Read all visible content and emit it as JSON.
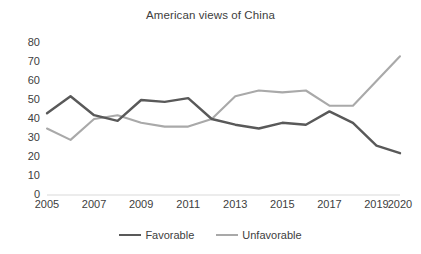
{
  "chart_data": {
    "type": "line",
    "title": "American views of China",
    "xlabel": "",
    "ylabel": "",
    "ylim": [
      0,
      80
    ],
    "yticks": [
      0,
      10,
      20,
      30,
      40,
      50,
      60,
      70,
      80
    ],
    "xticklabels": [
      "2005",
      "2007",
      "2009",
      "2011",
      "2013",
      "2015",
      "2017",
      "2019",
      "2020"
    ],
    "x": [
      2005,
      2006,
      2007,
      2008,
      2009,
      2010,
      2011,
      2012,
      2013,
      2014,
      2015,
      2016,
      2017,
      2018,
      2019,
      2020
    ],
    "grid": false,
    "legend_position": "bottom",
    "series": [
      {
        "name": "Favorable",
        "color": "#595959",
        "values": [
          43,
          52,
          42,
          39,
          50,
          49,
          51,
          40,
          37,
          35,
          38,
          37,
          44,
          38,
          26,
          22
        ]
      },
      {
        "name": "Unfavorable",
        "color": "#a9a9a9",
        "values": [
          35,
          29,
          40,
          42,
          38,
          36,
          36,
          40,
          52,
          55,
          54,
          55,
          47,
          47,
          60,
          73
        ]
      }
    ]
  },
  "legend": {
    "entries": [
      {
        "label": "Favorable"
      },
      {
        "label": "Unfavorable"
      }
    ]
  }
}
